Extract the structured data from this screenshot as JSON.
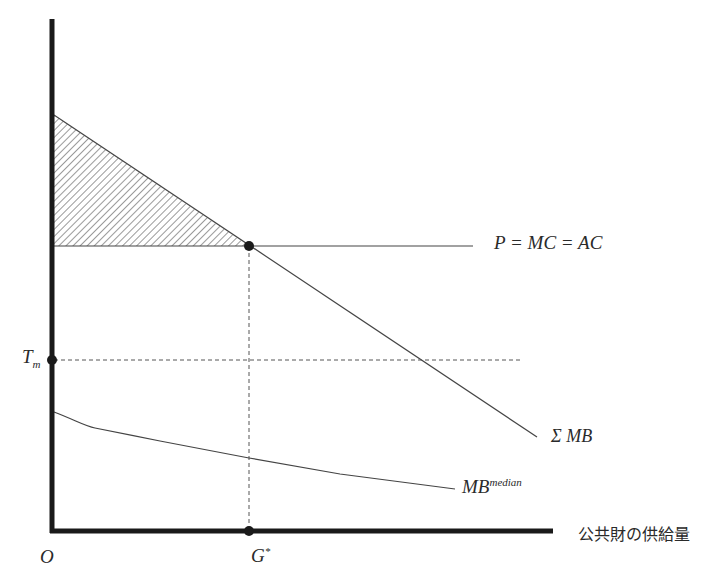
{
  "diagram": {
    "type": "economics-public-goods",
    "axes": {
      "origin_label": "O",
      "x_axis_label": "公共財の供給量",
      "x_marker_label": "G",
      "x_marker_sup": "*",
      "y_marker_label": "T",
      "y_marker_sub": "m"
    },
    "curves": {
      "supply_label": "P = MC = AC",
      "sum_mb_label": "Σ MB",
      "median_mb_label": "MB",
      "median_mb_sup": "median"
    },
    "colors": {
      "axis": "#1a1a1a",
      "line": "#444444",
      "dashed": "#555555",
      "hatch": "#555555",
      "background": "#ffffff"
    },
    "geometry": {
      "origin": [
        52,
        531
      ],
      "y_axis_top": 19,
      "x_axis_end": 553,
      "sum_mb_start": [
        53,
        115
      ],
      "equilibrium": [
        249,
        246
      ],
      "sum_mb_end": [
        537,
        437
      ],
      "supply_line_end_x": 473,
      "tm_y": 360,
      "tm_line_end_x": 521,
      "median_mb_points": [
        [
          53,
          412
        ],
        [
          95,
          428
        ],
        [
          160,
          441
        ],
        [
          249,
          458
        ],
        [
          340,
          474
        ],
        [
          455,
          489
        ]
      ]
    }
  }
}
